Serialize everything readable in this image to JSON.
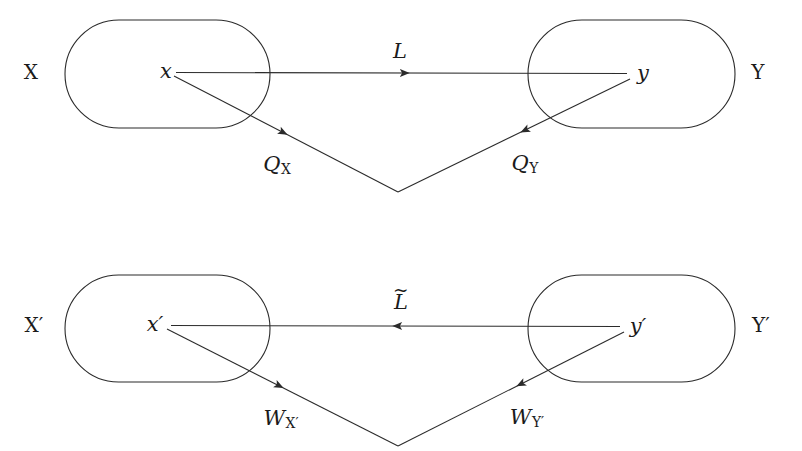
{
  "figure": {
    "type": "commutative-diagram",
    "background_color": "#ffffff",
    "stroke_color": "#2b2b2b",
    "text_color": "#1b1b1b"
  },
  "top": {
    "left_set": "X",
    "right_set": "Y",
    "left_point": "x",
    "right_point": "y",
    "horizontal_arrow_label": "L",
    "horizontal_arrow_direction": "right",
    "left_down_arrow_label_base": "Q",
    "left_down_arrow_label_sub": "X",
    "right_down_arrow_label_base": "Q",
    "right_down_arrow_label_sub": "Y"
  },
  "bottom": {
    "left_set": "X′",
    "right_set": "Y′",
    "left_point": "x′",
    "right_point": "y′",
    "horizontal_arrow_label_base": "L",
    "horizontal_arrow_label_accent": "~",
    "horizontal_arrow_direction": "left",
    "left_down_arrow_label_base": "W",
    "left_down_arrow_label_sub": "X′",
    "right_down_arrow_label_base": "W",
    "right_down_arrow_label_sub": "Y′"
  },
  "geometry": {
    "top_left_stadium": {
      "x": 65,
      "y": 20,
      "w": 205,
      "h": 108
    },
    "top_right_stadium": {
      "x": 528,
      "y": 20,
      "w": 207,
      "h": 108
    },
    "bottom_left_stadium": {
      "x": 65,
      "y": 275,
      "w": 205,
      "h": 107
    },
    "bottom_right_stadium": {
      "x": 528,
      "y": 275,
      "w": 207,
      "h": 107
    },
    "top_apex": [
      398,
      192
    ],
    "bottom_apex": [
      398,
      446
    ],
    "top_left_point": [
      167,
      72
    ],
    "top_right_point": [
      633,
      74
    ],
    "bottom_left_point": [
      159,
      325
    ],
    "bottom_right_point": [
      627,
      327
    ]
  }
}
